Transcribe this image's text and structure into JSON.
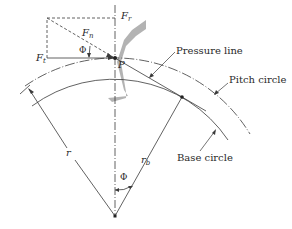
{
  "diagram": {
    "type": "gear tooth force diagram",
    "labels": {
      "force_radial": "F",
      "force_radial_sub": "r",
      "force_normal": "F",
      "force_normal_sub": "n",
      "force_tangential": "F",
      "force_tangential_sub": "t",
      "pressure_angle_top": "Φ",
      "pitch_point": "P",
      "pressure_line": "Pressure line",
      "pitch_circle": "Pitch circle",
      "base_circle": "Base circle",
      "pitch_radius": "r",
      "base_radius": "r",
      "base_radius_sub": "b",
      "pressure_angle_bottom": "Φ"
    },
    "colors": {
      "line": "#3a3a3a",
      "tooth_fill": "#b3b3b3",
      "background": "#ffffff"
    }
  }
}
